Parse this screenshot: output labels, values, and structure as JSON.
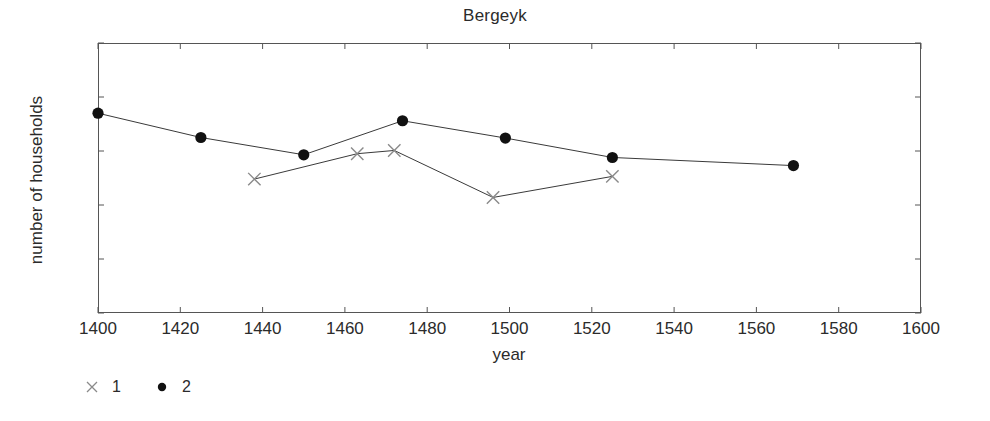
{
  "chart_data": {
    "type": "line",
    "title": "Bergeyk",
    "xlabel": "year",
    "ylabel": "number of households",
    "xlim": [
      1400,
      1600
    ],
    "ylim": [
      0,
      500
    ],
    "xticks": [
      1400,
      1420,
      1440,
      1460,
      1480,
      1500,
      1520,
      1540,
      1560,
      1580,
      1600
    ],
    "yticks": [
      0,
      100,
      200,
      300,
      400,
      500
    ],
    "grid": false,
    "legend_position": "below-left",
    "series": [
      {
        "name": "1",
        "marker": "x-cross",
        "x": [
          1438,
          1463,
          1472,
          1496,
          1525
        ],
        "values": [
          248,
          295,
          301,
          214,
          253
        ]
      },
      {
        "name": "2",
        "marker": "filled-circle",
        "x": [
          1400,
          1425,
          1450,
          1474,
          1499,
          1525,
          1569
        ],
        "values": [
          370,
          325,
          293,
          356,
          324,
          288,
          273
        ]
      }
    ]
  },
  "legend": {
    "entries": [
      {
        "label": "1",
        "marker": "x-cross-marker"
      },
      {
        "label": "2",
        "marker": "filled-circle-marker"
      }
    ]
  },
  "colors": {
    "axis": "#555555",
    "line": "#3a3a3a",
    "marker_series2": "#111111",
    "marker_series1": "#8a8a8a",
    "text": "#2b2b2b",
    "background": "#ffffff"
  }
}
